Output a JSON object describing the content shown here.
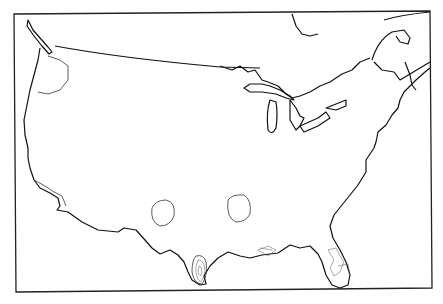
{
  "map": {
    "type": "contour-map",
    "region": "Contiguous United States",
    "colors": {
      "background": "#ffffff",
      "line": "#111111"
    },
    "features": [
      "coastline",
      "great-lakes",
      "canada-border",
      "contours-southwest",
      "contours-central",
      "contours-south-texas",
      "contours-florida",
      "contours-gulf-coast",
      "contours-pacific-northwest",
      "contours-california"
    ]
  }
}
